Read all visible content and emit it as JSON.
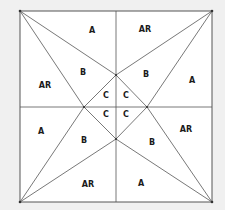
{
  "diagram": {
    "type": "geometric-pattern",
    "colors": {
      "background": "#f0f0f0",
      "square_fill": "#ffffff",
      "line": "#555555",
      "label": "#1a1a1a"
    },
    "square": {
      "x1": 20,
      "y1": 11,
      "x2": 212,
      "y2": 202
    },
    "center": {
      "x": 116,
      "y": 107
    },
    "diamond": {
      "top": [
        116,
        75
      ],
      "left": [
        84,
        107
      ],
      "right": [
        147,
        107
      ],
      "bottom": [
        116,
        139
      ]
    },
    "labels": [
      {
        "text": "A",
        "x": 92,
        "y": 30
      },
      {
        "text": "AR",
        "x": 145,
        "y": 29
      },
      {
        "text": "AR",
        "x": 45,
        "y": 85
      },
      {
        "text": "B",
        "x": 83,
        "y": 72
      },
      {
        "text": "B",
        "x": 146,
        "y": 74
      },
      {
        "text": "A",
        "x": 192,
        "y": 80
      },
      {
        "text": "C",
        "x": 106,
        "y": 95
      },
      {
        "text": "C",
        "x": 126,
        "y": 95
      },
      {
        "text": "C",
        "x": 106,
        "y": 114
      },
      {
        "text": "C",
        "x": 126,
        "y": 114
      },
      {
        "text": "A",
        "x": 41,
        "y": 131
      },
      {
        "text": "B",
        "x": 84,
        "y": 140
      },
      {
        "text": "AR",
        "x": 186,
        "y": 129
      },
      {
        "text": "B",
        "x": 152,
        "y": 142
      },
      {
        "text": "AR",
        "x": 88,
        "y": 184
      },
      {
        "text": "A",
        "x": 141,
        "y": 183
      }
    ]
  }
}
